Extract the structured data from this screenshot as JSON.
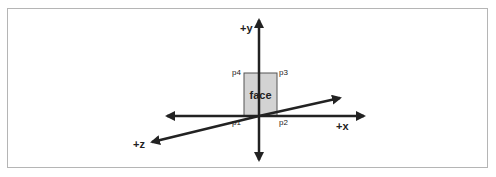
{
  "diagram": {
    "axes": [
      {
        "id": "y",
        "label": "+y"
      },
      {
        "id": "x",
        "label": "+x"
      },
      {
        "id": "z",
        "label": "+z"
      }
    ],
    "face": {
      "label": "face",
      "fill": "#d3d3d3",
      "corners": [
        {
          "id": "p1",
          "label": "p1"
        },
        {
          "id": "p2",
          "label": "p2"
        },
        {
          "id": "p3",
          "label": "p3"
        },
        {
          "id": "p4",
          "label": "p4"
        }
      ]
    },
    "colors": {
      "stroke": "#222222",
      "border": "#b5b5b5"
    }
  }
}
